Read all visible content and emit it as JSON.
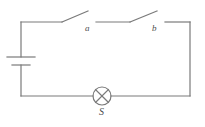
{
  "figure": {
    "kind": "circuit-diagram",
    "width": 205,
    "height": 127,
    "background_color": "#ffffff",
    "line_color": "#7a7a7a",
    "label_color": "#4d4d4d",
    "line_width": 1.2
  },
  "labels": {
    "switch_a": "a",
    "switch_b": "b",
    "lamp": "S"
  },
  "components": {
    "battery": {
      "name": "battery-cell",
      "position": "left-side",
      "long_plate_y": 57,
      "short_plate_y": 65,
      "long_plate_half_width": 14,
      "short_plate_half_width": 9,
      "x": 21
    },
    "switch_a": {
      "name": "knife-switch-a",
      "state": "open",
      "pivot_x": 62,
      "pivot_y": 22,
      "tip_x": 88,
      "tip_y": 11,
      "contact_x": 96
    },
    "switch_b": {
      "name": "knife-switch-b",
      "state": "open",
      "pivot_x": 130,
      "pivot_y": 22,
      "tip_x": 157,
      "tip_y": 11,
      "contact_x": 165
    },
    "lamp": {
      "name": "lamp-s",
      "center_x": 102,
      "center_y": 96,
      "radius": 9
    }
  },
  "frame": {
    "left_x": 21,
    "right_x": 190,
    "top_y": 22,
    "bottom_y": 96
  }
}
